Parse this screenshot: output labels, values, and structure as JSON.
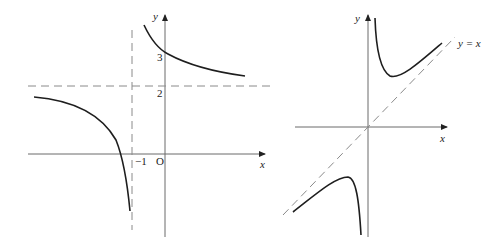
{
  "left_graph": {
    "axis_labels": {
      "x": "x",
      "y": "y"
    },
    "tick_labels": {
      "y3": "3",
      "y2": "2",
      "x_neg1": "−1",
      "origin": "O"
    },
    "asymptotes": {
      "vertical": "x = -1",
      "horizontal": "y = 2"
    },
    "colors": {
      "curve": "#1e1e1e",
      "axis": "#6a6a6a",
      "asymptote": "#8a8a8a"
    }
  },
  "right_graph": {
    "axis_labels": {
      "x": "x",
      "y": "y"
    },
    "asymptote_label": "y = x",
    "colors": {
      "curve": "#1e1e1e",
      "axis": "#6a6a6a",
      "asymptote": "#8a8a8a"
    }
  }
}
